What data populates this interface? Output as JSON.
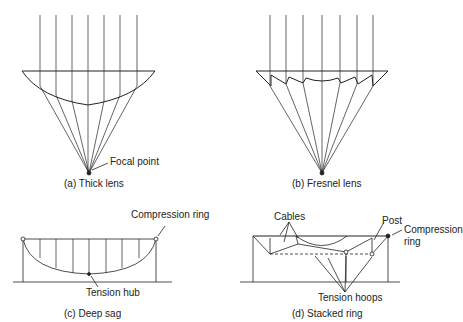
{
  "panels": {
    "a": {
      "caption": "(a) Thick lens",
      "labels": {
        "focal": "Focal point"
      }
    },
    "b": {
      "caption": "(b) Fresnel lens"
    },
    "c": {
      "caption": "(c) Deep sag",
      "labels": {
        "compression": "Compression ring",
        "hub": "Tension hub"
      }
    },
    "d": {
      "caption": "(d) Stacked ring",
      "labels": {
        "cables": "Cables",
        "post": "Post",
        "compression1": "Compression",
        "compression2": "ring",
        "hoops": "Tension hoops"
      }
    }
  },
  "colors": {
    "stroke": "#222222",
    "background": "#ffffff"
  }
}
